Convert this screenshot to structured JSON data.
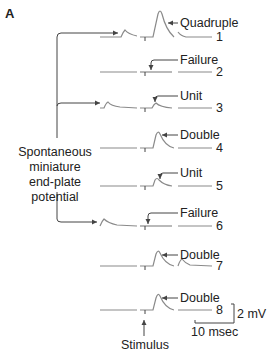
{
  "panel_label": "A",
  "side_label": {
    "line1": "Spontaneous",
    "line2": "miniature",
    "line3": "end-plate",
    "line4": "potential"
  },
  "traces": [
    {
      "number": "1",
      "annotation": "Quadruple"
    },
    {
      "number": "2",
      "annotation": "Failure"
    },
    {
      "number": "3",
      "annotation": "Unit"
    },
    {
      "number": "4",
      "annotation": "Double"
    },
    {
      "number": "5",
      "annotation": "Unit"
    },
    {
      "number": "6",
      "annotation": "Failure"
    },
    {
      "number": "7",
      "annotation": "Double"
    },
    {
      "number": "8",
      "annotation": "Double"
    }
  ],
  "stimulus_label": "Stimulus",
  "scale_bar": {
    "voltage": "2 mV",
    "time": "10 msec"
  },
  "colors": {
    "trace": "#8a8a8a",
    "line": "#444444",
    "text": "#222222"
  }
}
